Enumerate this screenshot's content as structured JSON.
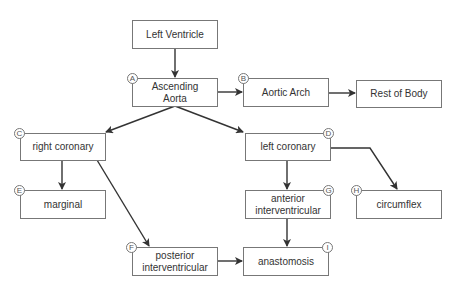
{
  "diagram": {
    "nodes": [
      {
        "id": "lv",
        "label": "Left Ventricle",
        "badge": ""
      },
      {
        "id": "asc",
        "label": "Ascending Aorta",
        "badge": "A"
      },
      {
        "id": "arch",
        "label": "Aortic Arch",
        "badge": "B"
      },
      {
        "id": "rest",
        "label": "Rest of Body",
        "badge": ""
      },
      {
        "id": "rca",
        "label": "right coronary",
        "badge": "C"
      },
      {
        "id": "lca",
        "label": "left coronary",
        "badge": "D"
      },
      {
        "id": "marg",
        "label": "marginal",
        "badge": "E"
      },
      {
        "id": "piv",
        "label": "posterior interventricular",
        "badge": "F"
      },
      {
        "id": "aiv",
        "label": "anterior interventricular",
        "badge": "G"
      },
      {
        "id": "circ",
        "label": "circumflex",
        "badge": "H"
      },
      {
        "id": "anas",
        "label": "anastomosis",
        "badge": "I"
      }
    ],
    "edges": [
      {
        "from": "Left Ventricle",
        "to": "Ascending Aorta"
      },
      {
        "from": "Ascending Aorta",
        "to": "Aortic Arch"
      },
      {
        "from": "Aortic Arch",
        "to": "Rest of Body"
      },
      {
        "from": "Ascending Aorta",
        "to": "right coronary"
      },
      {
        "from": "Ascending Aorta",
        "to": "left coronary"
      },
      {
        "from": "right coronary",
        "to": "marginal"
      },
      {
        "from": "right coronary",
        "to": "posterior interventricular"
      },
      {
        "from": "left coronary",
        "to": "anterior interventricular"
      },
      {
        "from": "left coronary",
        "to": "circumflex"
      },
      {
        "from": "anterior interventricular",
        "to": "anastomosis"
      },
      {
        "from": "posterior interventricular",
        "to": "anastomosis"
      }
    ]
  },
  "labels": {
    "lv": "Left Ventricle",
    "asc_1": "Ascending",
    "asc_2": "Aorta",
    "arch": "Aortic Arch",
    "rest": "Rest of Body",
    "rca": "right coronary",
    "lca": "left coronary",
    "marg": "marginal",
    "aiv_1": "anterior",
    "aiv_2": "interventricular",
    "circ": "circumflex",
    "piv_1": "posterior",
    "piv_2": "interventricular",
    "anas": "anastomosis"
  },
  "badges": {
    "A": "A",
    "B": "B",
    "C": "C",
    "D": "D",
    "E": "E",
    "F": "F",
    "G": "G",
    "H": "H",
    "I": "I"
  }
}
